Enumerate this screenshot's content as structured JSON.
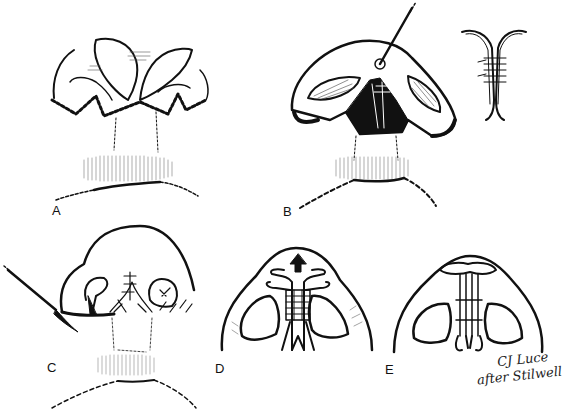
{
  "figure": {
    "panels": [
      {
        "id": "A",
        "label": "A",
        "description": "Nasal base with zig-zag (W-plasty) dashed incision lines, alar flaps elevated"
      },
      {
        "id": "B",
        "label": "B",
        "description": "Medial crura exposed and sutured together with needle; inset detail of sutured crura"
      },
      {
        "id": "C",
        "label": "C",
        "description": "Closure of incisions with interrupted sutures; scalpel at left alar base"
      },
      {
        "id": "D",
        "label": "D",
        "description": "Basal view: medial crura sutured, arrow indicating tip projection upward"
      },
      {
        "id": "E",
        "label": "E",
        "description": "Basal view: final columella strut with crura sutured"
      }
    ],
    "signature": {
      "line1": "CJ Luce",
      "line2": "after Stilwell"
    },
    "colors": {
      "ink": "#111111",
      "background": "#ffffff"
    }
  }
}
